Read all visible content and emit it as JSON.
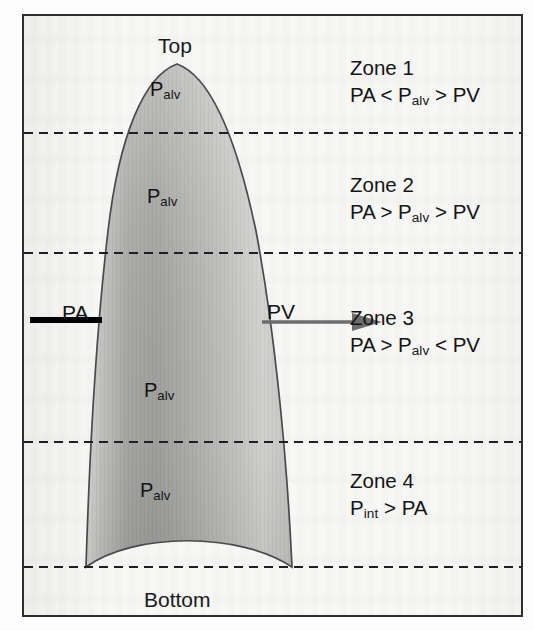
{
  "figure": {
    "type": "diagram",
    "orientation_labels": {
      "top": "Top",
      "bottom": "Bottom"
    },
    "vessel_labels": {
      "arterial": "PA",
      "venous": "PV"
    },
    "alveolar_labels": [
      {
        "base": "P",
        "sub": "alv"
      },
      {
        "base": "P",
        "sub": "alv"
      },
      {
        "base": "P",
        "sub": "alv"
      },
      {
        "base": "P",
        "sub": "alv"
      }
    ],
    "zones": [
      {
        "title": "Zone 1",
        "relation_prefix": "PA < P",
        "relation_sub": "alv",
        "relation_suffix": " > PV"
      },
      {
        "title": "Zone 2",
        "relation_prefix": "PA > P",
        "relation_sub": "alv",
        "relation_suffix": " > PV"
      },
      {
        "title": "Zone 3",
        "relation_prefix": "PA > P",
        "relation_sub": "alv",
        "relation_suffix": " < PV"
      },
      {
        "title": "Zone 4",
        "relation_prefix": "P",
        "relation_sub": "int",
        "relation_suffix": " > PA"
      }
    ],
    "colors": {
      "frame_border": "#2e2e2e",
      "page_background": "#f7f7f5",
      "lung_outline": "#4a4a4a",
      "lung_fill_light": "#e9e9e7",
      "lung_fill_mid": "#b9b9b7",
      "lung_fill_dark": "#9d9d9b",
      "dashed_line": "#1f1f1f",
      "pa_line": "#000000",
      "pv_arrow": "#6d6d6d",
      "text": "#141414"
    },
    "divider_count": 4
  }
}
